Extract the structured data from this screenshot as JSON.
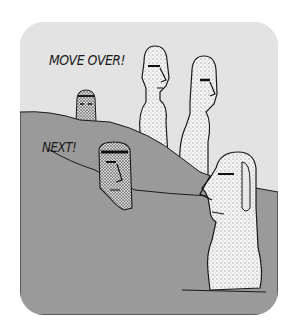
{
  "cartoon": {
    "captions": {
      "top": "MOVE OVER!",
      "middle": "NEXT!"
    },
    "colors": {
      "background": "#ffffff",
      "sky": "#e3e3e3",
      "ground": "#9a9a9a",
      "ink": "#1a1a1a",
      "stone": "#f4f4f4"
    },
    "figures": [
      {
        "name": "small-moai-head-on-ridge"
      },
      {
        "name": "tall-moai-left"
      },
      {
        "name": "tall-moai-right"
      },
      {
        "name": "moai-head-emerging-from-ground"
      },
      {
        "name": "large-moai-foreground"
      }
    ]
  }
}
